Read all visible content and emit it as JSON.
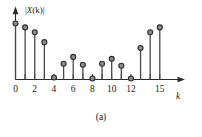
{
  "figure": {
    "caption": "(a)",
    "ylabel": "|X(k)|",
    "ylabel_var": "X",
    "xlabel": "k"
  },
  "chart_data": {
    "type": "bar",
    "subtype": "stem",
    "title": "",
    "subtitle": "",
    "xlabel": "k",
    "ylabel": "|X(k)|",
    "categories": [
      0,
      1,
      2,
      3,
      4,
      5,
      6,
      7,
      8,
      9,
      10,
      11,
      12,
      13,
      14,
      15
    ],
    "values": [
      57,
      53,
      48,
      38,
      2,
      16,
      23,
      15,
      1,
      16,
      21,
      14,
      1,
      32,
      48,
      53
    ],
    "x": [
      0,
      1,
      2,
      3,
      4,
      5,
      6,
      7,
      8,
      9,
      10,
      11,
      12,
      13,
      14,
      15
    ],
    "xlim": [
      0,
      15
    ],
    "ylim": [
      0,
      60
    ],
    "xticks": [
      0,
      1,
      2,
      3,
      4,
      5,
      6,
      7,
      8,
      9,
      10,
      11,
      12,
      13,
      14,
      15
    ],
    "xtick_labels": [
      "0",
      "",
      "2",
      "",
      "4",
      "",
      "6",
      "",
      "8",
      "",
      "10",
      "",
      "12",
      "",
      "",
      "15"
    ],
    "yticks": [],
    "ytick_labels": [],
    "grid": false,
    "legend": [],
    "legend_position": "none",
    "marker": "circle",
    "marker_fill": "#8c8c8c",
    "line_color": "#4a4a4a",
    "axis_color": "#2b2b2b",
    "annotations": []
  }
}
